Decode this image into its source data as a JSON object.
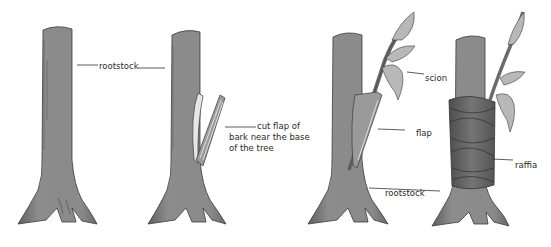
{
  "diagram": {
    "stages": [
      {
        "id": "stage-1",
        "name": "rootstock trunk"
      },
      {
        "id": "stage-2",
        "name": "cut bark flap"
      },
      {
        "id": "stage-3",
        "name": "scion inserted under flap"
      },
      {
        "id": "stage-4",
        "name": "graft wrapped with raffia"
      }
    ],
    "labels": {
      "rootstock_top": "rootstock",
      "cut_flap_line1": "cut flap of",
      "cut_flap_line2": "bark near the base",
      "cut_flap_line3": "of the tree",
      "scion": "scion",
      "flap": "flap",
      "rootstock_bottom": "rootstock",
      "raffia": "raffia"
    },
    "colors": {
      "bark": "#8a8a8a",
      "bark_shadow": "#5a5a5a",
      "outline": "#3a3a3a",
      "leaf": "#b5b5b5",
      "raffia": "#6e6e6e",
      "flap_inner": "#e8e8e8",
      "leader_line": "#333333"
    }
  }
}
